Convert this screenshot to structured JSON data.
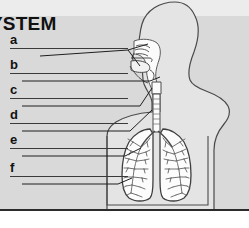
{
  "worksheet": {
    "title": "YSTEM",
    "title_note": "title is cropped at the left edge of the image",
    "background_color": "#d9d9d9",
    "ink_color": "#2b2b2b"
  },
  "questions": [
    {
      "letter": "a",
      "label_x": 10,
      "label_y": 40,
      "line_x": 10,
      "line_y": 56,
      "line_width": 118
    },
    {
      "letter": "b",
      "label_x": 10,
      "label_y": 65,
      "line_x": 10,
      "line_y": 81,
      "line_width": 118
    },
    {
      "letter": "c",
      "label_x": 10,
      "label_y": 90,
      "line_x": 10,
      "line_y": 106,
      "line_width": 118
    },
    {
      "letter": "d",
      "label_x": 10,
      "label_y": 115,
      "line_x": 10,
      "line_y": 131,
      "line_width": 118
    },
    {
      "letter": "e",
      "label_x": 10,
      "label_y": 140,
      "line_x": 10,
      "line_y": 156,
      "line_width": 118
    },
    {
      "letter": "f",
      "label_x": 10,
      "label_y": 168,
      "line_x": 10,
      "line_y": 184,
      "line_width": 118
    }
  ],
  "diagram": {
    "view": "human torso and head, side-facing sagittal cutaway",
    "parts": [
      "head-outline",
      "neck-outline",
      "torso-outline",
      "shoulder-outline",
      "nasal-cavity",
      "oral-cavity",
      "pharynx",
      "larynx",
      "trachea",
      "left-lung",
      "right-lung",
      "bronchial-tree",
      "diaphragm-region"
    ],
    "leader_lines": [
      {
        "from": "a",
        "points_to": "nasal-cavity"
      },
      {
        "from": "a",
        "points_to": "oral-cavity"
      },
      {
        "from": "b",
        "points_to": "pharynx"
      },
      {
        "from": "c",
        "points_to": "larynx"
      },
      {
        "from": "d",
        "points_to": "trachea"
      },
      {
        "from": "e",
        "points_to": "bronchus"
      },
      {
        "from": "f",
        "points_to": "lung"
      }
    ]
  }
}
